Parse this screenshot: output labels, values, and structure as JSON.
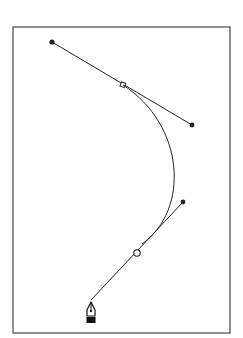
{
  "diagram": {
    "colors": {
      "stroke": "#222222",
      "frame": "#555555",
      "background": "#ffffff"
    },
    "frame": {
      "x": 13,
      "y": 27,
      "w": 217,
      "h": 306
    },
    "anchors": [
      {
        "id": "top-anchor",
        "x": 123,
        "y": 85,
        "style": "small"
      },
      {
        "id": "lower-anchor",
        "x": 137,
        "y": 253,
        "style": "hollow"
      }
    ],
    "handles": [
      {
        "id": "top-left-handle",
        "x": 52,
        "y": 42
      },
      {
        "id": "top-right-handle",
        "x": 192,
        "y": 125
      },
      {
        "id": "lower-right-handle",
        "x": 183,
        "y": 202
      },
      {
        "id": "lower-left-handle",
        "x": 91,
        "y": 300
      }
    ],
    "curve": {
      "from": [
        123,
        85
      ],
      "c1": [
        185,
        125
      ],
      "c2": [
        185,
        210
      ],
      "to": [
        140,
        245
      ]
    },
    "tool": {
      "name": "pen-tool",
      "x": 91,
      "y": 312
    }
  }
}
